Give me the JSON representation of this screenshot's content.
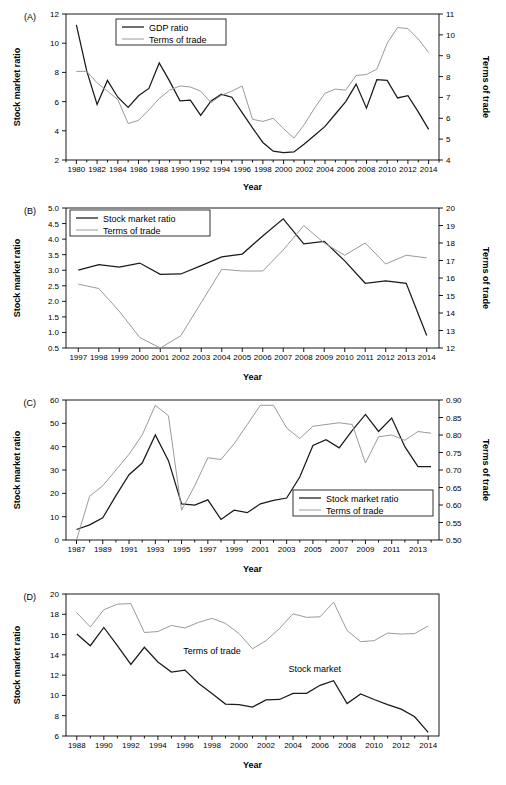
{
  "figure": {
    "background": "#ffffff",
    "dark_color": "#1a1a1a",
    "light_color": "#9a9a9a",
    "width": 506,
    "height": 785
  },
  "chart_data": [
    {
      "id": "A",
      "panel_letter": "(A)",
      "type": "line",
      "title": "",
      "xlabel": "Year",
      "ylabel": "Stock market ratio",
      "y2label": "Terms of trade",
      "xlim": [
        1979,
        2015
      ],
      "ylim": [
        2,
        12
      ],
      "y2lim": [
        4,
        11
      ],
      "yticks": [
        2,
        4,
        6,
        8,
        10,
        12
      ],
      "y2ticks": [
        4,
        5,
        6,
        7,
        8,
        9,
        10,
        11
      ],
      "xticks": [
        1980,
        1982,
        1984,
        1986,
        1988,
        1990,
        1992,
        1994,
        1996,
        1998,
        2000,
        2002,
        2004,
        2006,
        2008,
        2010,
        2012,
        2014
      ],
      "grid": false,
      "legend_position": "top-center",
      "x": [
        1980,
        1981,
        1982,
        1983,
        1984,
        1985,
        1986,
        1987,
        1988,
        1989,
        1990,
        1991,
        1992,
        1993,
        1994,
        1995,
        1996,
        1997,
        1998,
        1999,
        2000,
        2001,
        2002,
        2003,
        2004,
        2005,
        2006,
        2007,
        2008,
        2009,
        2010,
        2011,
        2012,
        2013,
        2014
      ],
      "series": [
        {
          "name": "GDP ratio",
          "axis": "left",
          "color": "#1a1a1a",
          "values": [
            11.25,
            8.1,
            5.8,
            7.45,
            6.3,
            5.6,
            6.4,
            6.9,
            8.65,
            7.4,
            6.05,
            6.1,
            5.05,
            6.05,
            6.5,
            6.3,
            5.25,
            4.2,
            3.2,
            2.6,
            2.5,
            2.55,
            3.1,
            3.7,
            4.3,
            5.15,
            6.0,
            7.2,
            5.55,
            7.5,
            7.45,
            6.25,
            6.4,
            5.3,
            4.1
          ]
        },
        {
          "name": "Terms of trade",
          "axis": "right",
          "color": "#9a9a9a",
          "values": [
            8.25,
            8.25,
            7.7,
            7.3,
            6.9,
            5.75,
            5.9,
            6.4,
            6.95,
            7.35,
            7.55,
            7.5,
            7.3,
            6.75,
            7.1,
            7.3,
            7.55,
            5.95,
            5.85,
            6.0,
            5.5,
            5.05,
            5.7,
            6.5,
            7.2,
            7.4,
            7.35,
            8.05,
            8.1,
            8.35,
            9.6,
            10.35,
            10.3,
            9.8,
            9.15
          ]
        }
      ]
    },
    {
      "id": "B",
      "panel_letter": "(B)",
      "type": "line",
      "title": "",
      "xlabel": "Year",
      "ylabel": "Stock market ratio",
      "y2label": "Terms of trade",
      "xlim": [
        1996.4,
        2014.6
      ],
      "ylim": [
        0.5,
        5.0
      ],
      "y2lim": [
        12,
        20
      ],
      "yticks": [
        0.5,
        1.0,
        1.5,
        2.0,
        2.5,
        3.0,
        3.5,
        4.0,
        4.5,
        5.0
      ],
      "y2ticks": [
        12,
        13,
        14,
        15,
        16,
        17,
        18,
        19,
        20
      ],
      "xticks": [
        1997,
        1998,
        1999,
        2000,
        2001,
        2002,
        2003,
        2004,
        2005,
        2006,
        2007,
        2008,
        2009,
        2010,
        2011,
        2012,
        2013,
        2014
      ],
      "grid": false,
      "legend_position": "top-left",
      "x": [
        1997,
        1998,
        1999,
        2000,
        2001,
        2002,
        2003,
        2004,
        2005,
        2006,
        2007,
        2008,
        2009,
        2010,
        2011,
        2012,
        2013,
        2014
      ],
      "series": [
        {
          "name": "Stock market ratio",
          "axis": "left",
          "color": "#1a1a1a",
          "values": [
            3.0,
            3.18,
            3.1,
            3.23,
            2.87,
            2.88,
            3.15,
            3.43,
            3.52,
            4.1,
            4.65,
            3.85,
            3.93,
            3.3,
            2.58,
            2.66,
            2.58,
            0.9
          ]
        },
        {
          "name": "Terms of trade",
          "axis": "right",
          "color": "#9a9a9a",
          "values": [
            15.65,
            15.4,
            14.1,
            12.6,
            12.0,
            12.7,
            14.6,
            16.5,
            16.4,
            16.4,
            17.6,
            19.0,
            18.0,
            17.3,
            18.0,
            16.8,
            17.3,
            17.15
          ]
        }
      ]
    },
    {
      "id": "C",
      "panel_letter": "(C)",
      "type": "line",
      "title": "",
      "xlabel": "Year",
      "ylabel": "Stock market ratio",
      "y2label": "Terms of trade",
      "xlim": [
        1986.2,
        2014.6
      ],
      "ylim": [
        0,
        60
      ],
      "y2lim": [
        0.5,
        0.9
      ],
      "yticks": [
        0,
        10,
        20,
        30,
        40,
        50,
        60
      ],
      "y2ticks": [
        0.5,
        0.55,
        0.6,
        0.65,
        0.7,
        0.75,
        0.8,
        0.85,
        0.9
      ],
      "xticks": [
        1987,
        1989,
        1991,
        1993,
        1995,
        1997,
        1999,
        2001,
        2003,
        2005,
        2007,
        2009,
        2011,
        2013
      ],
      "grid": false,
      "legend_position": "bottom-right",
      "x": [
        1987,
        1988,
        1989,
        1990,
        1991,
        1992,
        1993,
        1994,
        1995,
        1996,
        1997,
        1998,
        1999,
        2000,
        2001,
        2002,
        2003,
        2004,
        2005,
        2006,
        2007,
        2008,
        2009,
        2010,
        2011,
        2012,
        2013,
        2014
      ],
      "series": [
        {
          "name": "Stock market ratio",
          "axis": "left",
          "color": "#1a1a1a",
          "values": [
            4.5,
            6.5,
            9.5,
            19.0,
            28.0,
            33.0,
            45.0,
            34.0,
            15.5,
            15.0,
            17.2,
            8.8,
            12.8,
            11.7,
            15.5,
            17.0,
            18.0,
            27.0,
            40.5,
            43.0,
            39.5,
            47.0,
            53.8,
            46.5,
            52.3,
            40.0,
            31.5,
            31.5
          ]
        },
        {
          "name": "Terms of trade",
          "axis": "right",
          "color": "#9a9a9a",
          "values": [
            0.5,
            0.625,
            0.655,
            0.7,
            0.745,
            0.8,
            0.885,
            0.855,
            0.585,
            0.655,
            0.735,
            0.73,
            0.775,
            0.83,
            0.885,
            0.885,
            0.82,
            0.79,
            0.825,
            0.83,
            0.835,
            0.83,
            0.72,
            0.795,
            0.8,
            0.785,
            0.81,
            0.805
          ]
        }
      ]
    },
    {
      "id": "D",
      "panel_letter": "(D)",
      "type": "line",
      "title": "",
      "xlabel": "Year",
      "ylabel": "Stock market ratio",
      "y2label": "",
      "xlim": [
        1987.2,
        2014.8
      ],
      "ylim": [
        6,
        20
      ],
      "y2lim": null,
      "yticks": [
        6,
        8,
        10,
        12,
        14,
        16,
        18,
        20
      ],
      "y2ticks": [],
      "xticks": [
        1988,
        1990,
        1992,
        1994,
        1996,
        1998,
        2000,
        2002,
        2004,
        2006,
        2008,
        2010,
        2012,
        2014
      ],
      "grid": false,
      "legend_position": "inline",
      "inline_labels": [
        {
          "text": "Terms of trade",
          "x": 1998.0,
          "y": 14.1
        },
        {
          "text": "Stock market",
          "x": 2005.6,
          "y": 12.3
        }
      ],
      "x": [
        1988,
        1989,
        1990,
        1991,
        1992,
        1993,
        1994,
        1995,
        1996,
        1997,
        1998,
        1999,
        2000,
        2001,
        2002,
        2003,
        2004,
        2005,
        2006,
        2007,
        2008,
        2009,
        2010,
        2011,
        2012,
        2013,
        2014
      ],
      "series": [
        {
          "name": "Stock market",
          "axis": "left",
          "color": "#1a1a1a",
          "values": [
            16.05,
            14.9,
            16.7,
            14.9,
            13.05,
            14.75,
            13.3,
            12.3,
            12.5,
            11.2,
            10.2,
            9.15,
            9.1,
            8.85,
            9.55,
            9.6,
            10.2,
            10.2,
            11.0,
            11.45,
            9.2,
            10.15,
            9.6,
            9.1,
            8.65,
            7.9,
            6.35
          ]
        },
        {
          "name": "Terms of trade",
          "axis": "left",
          "color": "#9a9a9a",
          "values": [
            18.15,
            16.75,
            18.45,
            19.0,
            19.05,
            16.2,
            16.3,
            16.9,
            16.65,
            17.2,
            17.6,
            17.1,
            16.1,
            14.6,
            15.4,
            16.6,
            18.05,
            17.7,
            17.75,
            19.2,
            16.4,
            15.3,
            15.4,
            16.15,
            16.05,
            16.1,
            16.85
          ]
        }
      ]
    }
  ]
}
